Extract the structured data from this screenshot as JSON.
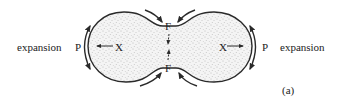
{
  "labels": {
    "left_expansion": "expansion",
    "right_expansion": "expansion",
    "left_p": "P",
    "right_p": "P",
    "left_x": "X",
    "right_x": "X",
    "top_f": "F",
    "bottom_f": "F",
    "panel": "(a)"
  },
  "colors": {
    "stroke": "#2a2a2a",
    "fill": "#f3f3f3",
    "stipple": "#8a8a8a"
  }
}
